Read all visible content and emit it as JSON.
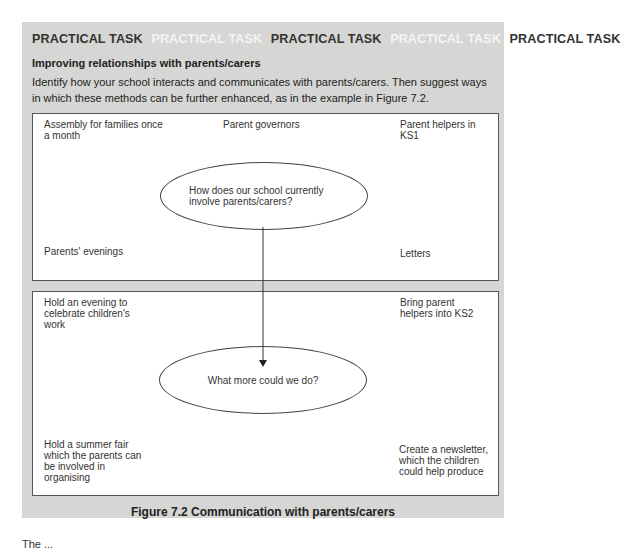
{
  "banner": {
    "items": [
      {
        "text": "PRACTICAL TASK",
        "tone": "dark"
      },
      {
        "text": "PRACTICAL TASK",
        "tone": "light"
      },
      {
        "text": "PRACTICAL TASK",
        "tone": "dark"
      },
      {
        "text": "PRACTICAL TASK",
        "tone": "light"
      },
      {
        "text": "PRACTICAL TASK",
        "tone": "dark"
      }
    ]
  },
  "task": {
    "heading": "Improving relationships with parents/carers",
    "body": "Identify how your school interacts and communicates with parents/carers. Then suggest ways in which these methods can be further enhanced, as in the example in Figure 7.2."
  },
  "diagram": {
    "top": {
      "question": "How does our school currently involve parents/carers?",
      "notes": {
        "top_left": "Assembly for families once a month",
        "top_center": "Parent governors",
        "top_right": "Parent helpers in KS1",
        "bottom_left": "Parents' evenings",
        "bottom_right": "Letters"
      }
    },
    "bottom": {
      "question": "What more could we do?",
      "notes": {
        "top_left": "Hold an evening to celebrate children's work",
        "top_right": "Bring parent helpers into KS2",
        "bottom_left": "Hold a summer fair which the parents can be involved in organising",
        "bottom_right": "Create a newsletter, which the children could help produce"
      }
    }
  },
  "caption": "Figure 7.2 Communication with parents/carers",
  "trailing_text": "The ...",
  "colors": {
    "panel": "#d6d6d4",
    "banner_dark": "#333333",
    "banner_light": "#f4f4f4"
  }
}
